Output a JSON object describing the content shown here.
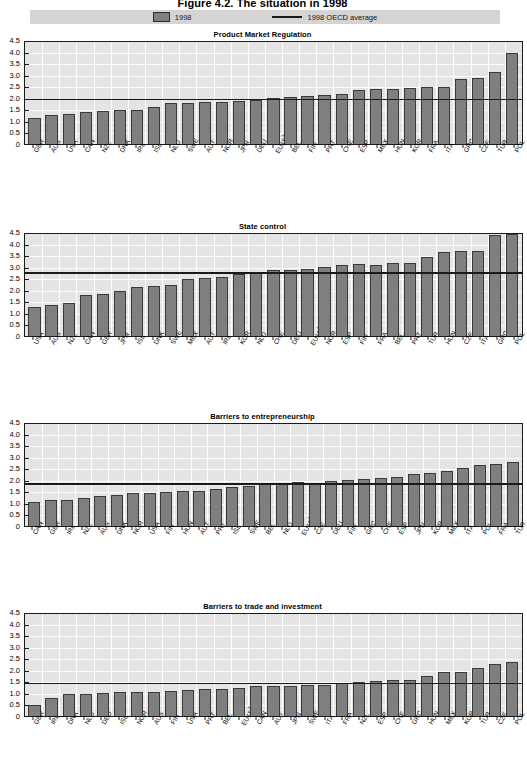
{
  "figure": {
    "title": "Figure 4.2. The situation in 1998"
  },
  "legend": {
    "bar_label": "1998",
    "line_label": "1998 OECD average",
    "bar_color": "#7f7f7f",
    "line_color": "#1a1a1a"
  },
  "axis": {
    "ticks": [
      "4.5",
      "4.0",
      "3.5",
      "3.0",
      "2.5",
      "2.0",
      "1.5",
      "1.0",
      "0.5",
      "0"
    ]
  },
  "chart_data": [
    {
      "type": "bar",
      "title": "Product Market Regulation",
      "xlabel": "",
      "ylabel": "",
      "ylim": [
        0,
        4.5
      ],
      "grid": true,
      "legend_position": "top",
      "average_label": "1998 OECD average",
      "average": 2.05,
      "categories": [
        "GBR",
        "AUS",
        "USA",
        "CAN",
        "NZL",
        "DNK",
        "IRL",
        "ISL",
        "NLD",
        "SWE",
        "AUT",
        "NOR",
        "JPN",
        "DEU",
        "EU15²",
        "BEL",
        "FIN",
        "PRT",
        "CHE",
        "ESP",
        "MEX",
        "HUN",
        "KOR",
        "FRA",
        "ITA",
        "GRC",
        "CZE",
        "TUR",
        "POL"
      ],
      "values": [
        1.14,
        1.27,
        1.3,
        1.4,
        1.44,
        1.47,
        1.48,
        1.6,
        1.79,
        1.79,
        1.8,
        1.83,
        1.86,
        1.9,
        2.0,
        2.05,
        2.07,
        2.12,
        2.17,
        2.35,
        2.38,
        2.4,
        2.42,
        2.45,
        2.45,
        2.8,
        2.85,
        3.1,
        3.95
      ]
    },
    {
      "type": "bar",
      "title": "State control",
      "xlabel": "",
      "ylabel": "",
      "ylim": [
        0,
        4.5
      ],
      "grid": true,
      "legend_position": "top",
      "average_label": "1998 OECD average",
      "average": 2.85,
      "categories": [
        "USA",
        "AUS",
        "NZL",
        "CAN",
        "GBR",
        "JPN",
        "ISL",
        "DNK",
        "SWE",
        "MEX",
        "AUT",
        "IRL",
        "KOR",
        "NLD",
        "CHE",
        "DEU",
        "EU15²",
        "NOR",
        "ESP",
        "FIN",
        "FRA",
        "BEL",
        "PRT",
        "TUR",
        "HUN",
        "CZE",
        "ITA",
        "GRC",
        "POL"
      ],
      "values": [
        1.25,
        1.35,
        1.45,
        1.78,
        1.83,
        1.93,
        2.1,
        2.17,
        2.2,
        2.45,
        2.53,
        2.57,
        2.67,
        2.75,
        2.85,
        2.87,
        2.92,
        2.97,
        3.08,
        3.1,
        3.08,
        3.15,
        3.15,
        3.42,
        3.62,
        3.67,
        3.7,
        4.37,
        4.42
      ]
    },
    {
      "type": "bar",
      "title": "Barriers to entrepreneurship",
      "xlabel": "",
      "ylabel": "",
      "ylim": [
        0,
        4.5
      ],
      "grid": true,
      "legend_position": "top",
      "average_label": "1998 OECD average",
      "average": 1.95,
      "categories": [
        "CAN",
        "GBR",
        "IRL",
        "NZL",
        "AUS",
        "DNK",
        "NOR",
        "USA",
        "FIN",
        "HUN",
        "AUT",
        "PRT",
        "ISL",
        "SWE",
        "BEL",
        "NLD",
        "EU15²",
        "CZE",
        "DEU",
        "FIN",
        "GRC",
        "CHE",
        "ESP",
        "JPN",
        "KOR",
        "MEX",
        "ITA",
        "POL",
        "FRA",
        "TUR"
      ],
      "values": [
        1.02,
        1.12,
        1.14,
        1.2,
        1.28,
        1.33,
        1.42,
        1.44,
        1.47,
        1.5,
        1.5,
        1.62,
        1.68,
        1.75,
        1.83,
        1.85,
        1.9,
        1.88,
        1.93,
        2.0,
        2.05,
        2.07,
        2.1,
        2.25,
        2.28,
        2.37,
        2.52,
        2.65,
        2.67,
        2.78,
        2.8,
        3.23
      ]
    },
    {
      "type": "bar",
      "title": "Barriers to trade and investment",
      "xlabel": "",
      "ylabel": "",
      "ylim": [
        0,
        4.5
      ],
      "grid": true,
      "legend_position": "top",
      "average_label": "1998 OECD average",
      "average": 1.53,
      "categories": [
        "GBR",
        "IRL",
        "DNK",
        "NLD",
        "DEU",
        "ISL",
        "NOR",
        "AUS",
        "FIN",
        "USA",
        "PRT",
        "BEL",
        "EU15²",
        "CAN",
        "AUT",
        "JPN",
        "SWE",
        "ITA",
        "FRA",
        "NZL",
        "ESP",
        "CHE",
        "GRC",
        "HUN",
        "MEX",
        "KOR",
        "TUR",
        "CZE",
        "POL"
      ],
      "values": [
        0.48,
        0.8,
        0.95,
        0.95,
        0.98,
        1.03,
        1.05,
        1.05,
        1.1,
        1.12,
        1.18,
        1.18,
        1.23,
        1.3,
        1.3,
        1.32,
        1.33,
        1.35,
        1.42,
        1.48,
        1.53,
        1.57,
        1.58,
        1.72,
        1.92,
        1.92,
        2.07,
        2.25,
        2.33,
        3.13,
        4.35
      ]
    }
  ]
}
